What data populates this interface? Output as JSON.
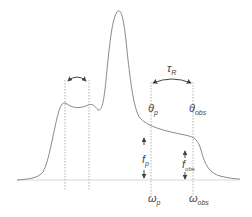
{
  "diagram": {
    "labels": {
      "tau": "τ",
      "tau_sub": "R",
      "theta_p": "θ",
      "theta_p_sub": "p",
      "theta_obs": "θ",
      "theta_obs_sub": "obs",
      "f_p": "f",
      "f_p_sub": "p",
      "f_obs": "f",
      "f_obs_sub": "obs",
      "omega_p": "ω",
      "omega_p_sub": "p",
      "omega_obs": "ω",
      "omega_obs_sub": "obs"
    },
    "colors": {
      "curve": "#8a8a8a",
      "guides": "#b0b0b0",
      "baseline": "#d8d8d8",
      "arrows": "#444444",
      "text": "#444444"
    }
  }
}
